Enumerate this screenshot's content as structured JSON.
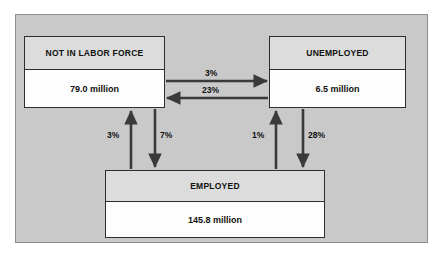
{
  "diagram": {
    "panel_background": "#c9c9c9",
    "panel_border": "#8e8e8e",
    "arrow_color": "#3a3a3a",
    "node_header_background": "#dcdcdc",
    "node_value_background": "#fdfdfd",
    "node_border": "#2e2e2e",
    "nodes": [
      {
        "id": "not-in-labor-force",
        "label": "NOT IN LABOR FORCE",
        "value": "79.0 million"
      },
      {
        "id": "unemployed",
        "label": "UNEMPLOYED",
        "value": "6.5 million"
      },
      {
        "id": "employed",
        "label": "EMPLOYED",
        "value": "145.8 million"
      }
    ],
    "edges": [
      {
        "id": "nilf-to-unemployed",
        "label": "3%",
        "from": "not-in-labor-force",
        "to": "unemployed",
        "direction": "right"
      },
      {
        "id": "unemployed-to-nilf",
        "label": "23%",
        "from": "unemployed",
        "to": "not-in-labor-force",
        "direction": "left"
      },
      {
        "id": "employed-to-nilf",
        "label": "3%",
        "from": "employed",
        "to": "not-in-labor-force",
        "direction": "up"
      },
      {
        "id": "nilf-to-employed",
        "label": "7%",
        "from": "not-in-labor-force",
        "to": "employed",
        "direction": "down"
      },
      {
        "id": "employed-to-unemployed",
        "label": "1%",
        "from": "employed",
        "to": "unemployed",
        "direction": "up"
      },
      {
        "id": "unemployed-to-employed",
        "label": "28%",
        "from": "unemployed",
        "to": "employed",
        "direction": "down"
      }
    ]
  }
}
